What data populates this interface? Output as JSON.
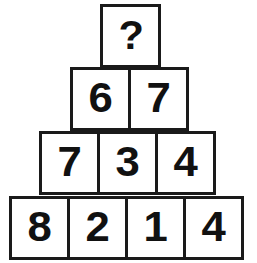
{
  "puzzle": {
    "type": "number-pyramid",
    "unknown_marker": "?",
    "rows": [
      {
        "index": 1,
        "cells": [
          {
            "value": "?"
          }
        ]
      },
      {
        "index": 2,
        "cells": [
          {
            "value": "6"
          },
          {
            "value": "7"
          }
        ]
      },
      {
        "index": 3,
        "cells": [
          {
            "value": "7"
          },
          {
            "value": "3"
          },
          {
            "value": "4"
          }
        ]
      },
      {
        "index": 4,
        "cells": [
          {
            "value": "8"
          },
          {
            "value": "2"
          },
          {
            "value": "1"
          },
          {
            "value": "4"
          }
        ]
      }
    ]
  },
  "colors": {
    "background": "#ffffff",
    "cell_fill": "#ffffff",
    "cell_border": "#1a1a1a",
    "digit": "#111111"
  }
}
